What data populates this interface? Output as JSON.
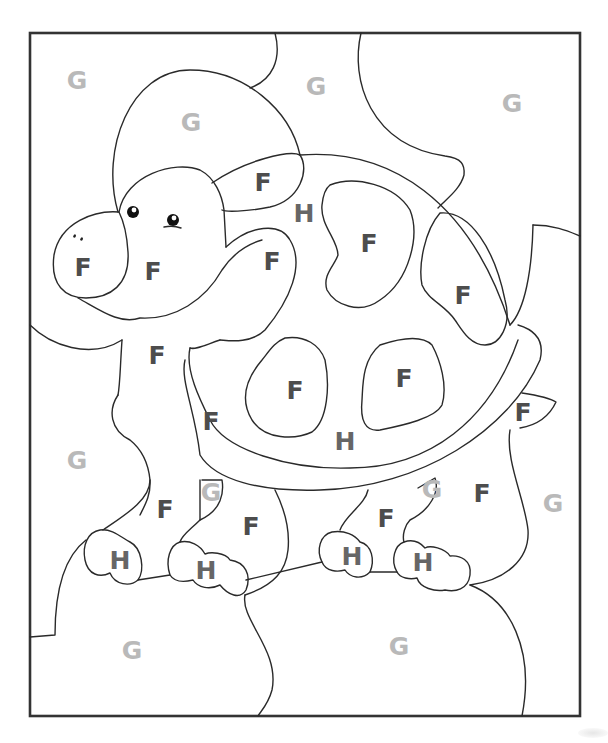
{
  "page": {
    "colors": {
      "F": "#4d4d4d",
      "G": "#b9b9b9",
      "H": "#666666",
      "outline": "#2a2a2a",
      "frame": "#333333"
    }
  },
  "labels": [
    {
      "id": "g-top-left",
      "letter": "G",
      "x": 77,
      "y": 80
    },
    {
      "id": "g-hat",
      "letter": "G",
      "x": 191,
      "y": 122
    },
    {
      "id": "g-top-mid",
      "letter": "G",
      "x": 316,
      "y": 86
    },
    {
      "id": "g-top-right",
      "letter": "G",
      "x": 512,
      "y": 103
    },
    {
      "id": "f-cheek-shell",
      "letter": "F",
      "x": 263,
      "y": 182
    },
    {
      "id": "h-shell-top",
      "letter": "H",
      "x": 304,
      "y": 213
    },
    {
      "id": "f-shell-spot-top",
      "letter": "F",
      "x": 369,
      "y": 243
    },
    {
      "id": "f-nose",
      "letter": "F",
      "x": 83,
      "y": 267
    },
    {
      "id": "f-face",
      "letter": "F",
      "x": 153,
      "y": 271
    },
    {
      "id": "f-neck-spot",
      "letter": "F",
      "x": 272,
      "y": 261
    },
    {
      "id": "f-shell-right",
      "letter": "F",
      "x": 463,
      "y": 295
    },
    {
      "id": "f-neck",
      "letter": "F",
      "x": 157,
      "y": 355
    },
    {
      "id": "f-shell-spot-left",
      "letter": "F",
      "x": 295,
      "y": 390
    },
    {
      "id": "f-shell-spot-right",
      "letter": "F",
      "x": 404,
      "y": 378
    },
    {
      "id": "f-tail",
      "letter": "F",
      "x": 523,
      "y": 412
    },
    {
      "id": "f-body-left",
      "letter": "F",
      "x": 211,
      "y": 421
    },
    {
      "id": "h-shell-bottom",
      "letter": "H",
      "x": 345,
      "y": 441
    },
    {
      "id": "g-left",
      "letter": "G",
      "x": 77,
      "y": 460
    },
    {
      "id": "g-between-front-legs",
      "letter": "G",
      "x": 211,
      "y": 492
    },
    {
      "id": "g-between-back-legs",
      "letter": "G",
      "x": 432,
      "y": 489
    },
    {
      "id": "f-back-leg-right",
      "letter": "F",
      "x": 482,
      "y": 493
    },
    {
      "id": "g-right",
      "letter": "G",
      "x": 553,
      "y": 503
    },
    {
      "id": "f-front-leg-left",
      "letter": "F",
      "x": 165,
      "y": 509
    },
    {
      "id": "f-front-leg-right",
      "letter": "F",
      "x": 251,
      "y": 526
    },
    {
      "id": "f-back-leg-left",
      "letter": "F",
      "x": 386,
      "y": 518
    },
    {
      "id": "h-foot-1",
      "letter": "H",
      "x": 120,
      "y": 560
    },
    {
      "id": "h-foot-2",
      "letter": "H",
      "x": 206,
      "y": 570
    },
    {
      "id": "h-foot-3",
      "letter": "H",
      "x": 352,
      "y": 556
    },
    {
      "id": "h-foot-4",
      "letter": "H",
      "x": 423,
      "y": 562
    },
    {
      "id": "g-bottom-left",
      "letter": "G",
      "x": 132,
      "y": 650
    },
    {
      "id": "g-bottom-right",
      "letter": "G",
      "x": 399,
      "y": 646
    }
  ]
}
